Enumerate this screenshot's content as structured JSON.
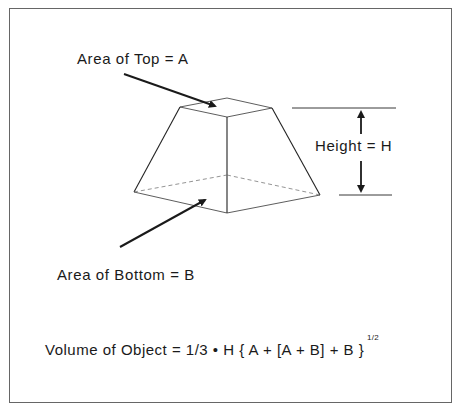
{
  "diagram": {
    "labels": {
      "top_area": "Area of Top = A",
      "bottom_area": "Area of Bottom = B",
      "height": "Height = H"
    },
    "formula": {
      "text": "Volume of Object = 1/3 • H { A + [A + B] + B }",
      "exponent": "1/2"
    },
    "colors": {
      "line": "#1a1a1a",
      "frame": "#666666",
      "background": "#ffffff"
    }
  }
}
